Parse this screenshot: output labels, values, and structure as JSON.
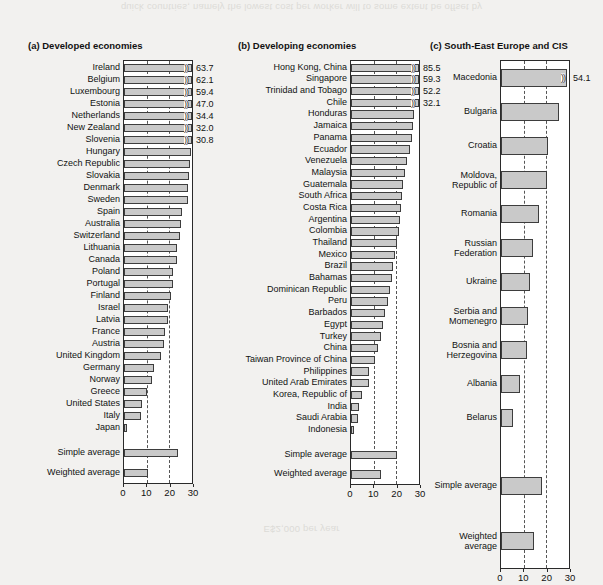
{
  "figure": {
    "bleed_top": "quick countries, namely the lowest cost per worker will to some extent be offset by",
    "bleed_bottom": "E$2,000 per year"
  },
  "axis": {
    "ticks": [
      0,
      10,
      20,
      30
    ],
    "tick_labels": [
      "0",
      "10",
      "20",
      "30"
    ],
    "gridlines": [
      10,
      20
    ],
    "xmin": 0,
    "xmax": 30
  },
  "colors": {
    "bar_fill": "#c9c9c9",
    "bar_stroke": "#3d3d3d",
    "grid": "#555555",
    "page_bg": "#f2f1ef",
    "plot_bg": "#ffffff"
  },
  "chart_data": [
    {
      "type": "bar",
      "title": "(a) Developed economies",
      "xlabel": "",
      "ylabel": "",
      "xlim": [
        0,
        30
      ],
      "grid": true,
      "orientation": "horizontal",
      "categories": [
        "Ireland",
        "Belgium",
        "Luxembourg",
        "Estonia",
        "Netherlands",
        "New Zealand",
        "Slovenia",
        "Hungary",
        "Czech Republic",
        "Slovakia",
        "Denmark",
        "Sweden",
        "Spain",
        "Australia",
        "Switzerland",
        "Lithuania",
        "Canada",
        "Poland",
        "Portugal",
        "Finland",
        "Israel",
        "Latvia",
        "France",
        "Austria",
        "United Kingdom",
        "Germany",
        "Norway",
        "Greece",
        "United States",
        "Italy",
        "Japan"
      ],
      "values": [
        63.7,
        62.1,
        59.4,
        47.0,
        34.4,
        32.0,
        30.8,
        29.4,
        28.9,
        28.6,
        28.4,
        28.2,
        25.4,
        25.2,
        24.8,
        23.4,
        23.2,
        21.7,
        21.4,
        20.9,
        19.6,
        19.3,
        18.1,
        17.5,
        16.3,
        13.4,
        12.2,
        10.2,
        7.9,
        7.4,
        1.4
      ],
      "clipped": [
        true,
        true,
        true,
        true,
        true,
        true,
        true,
        false,
        false,
        false,
        false,
        false,
        false,
        false,
        false,
        false,
        false,
        false,
        false,
        false,
        false,
        false,
        false,
        false,
        false,
        false,
        false,
        false,
        false,
        false,
        false
      ],
      "value_labels": [
        "63.7",
        "62.1",
        "59.4",
        "47.0",
        "34.4",
        "32.0",
        "30.8",
        "",
        "",
        "",
        "",
        "",
        "",
        "",
        "",
        "",
        "",
        "",
        "",
        "",
        "",
        "",
        "",
        "",
        "",
        "",
        "",
        "",
        "",
        "",
        ""
      ],
      "summary": [
        {
          "label": "Simple average",
          "value": 23.8
        },
        {
          "label": "Weighted average",
          "value": 10.6
        }
      ]
    },
    {
      "type": "bar",
      "title": "(b) Developing economies",
      "xlabel": "",
      "ylabel": "",
      "xlim": [
        0,
        30
      ],
      "grid": true,
      "orientation": "horizontal",
      "categories": [
        "Hong Kong, China",
        "Singapore",
        "Trinidad and Tobago",
        "Chile",
        "Honduras",
        "Jamaica",
        "Panama",
        "Ecuador",
        "Venezuela",
        "Malaysia",
        "Guatemala",
        "South Africa",
        "Costa Rica",
        "Argentina",
        "Colombia",
        "Thailand",
        "Mexico",
        "Brazil",
        "Bahamas",
        "Dominican Republic",
        "Peru",
        "Barbados",
        "Egypt",
        "Turkey",
        "China",
        "Taiwan Province of China",
        "Philippines",
        "United Arab Emirates",
        "Korea, Republic of",
        "India",
        "Saudi Arabia",
        "Indonesia"
      ],
      "values": [
        85.5,
        59.3,
        52.2,
        32.1,
        27.7,
        27.4,
        26.9,
        25.9,
        24.6,
        23.9,
        22.8,
        22.4,
        21.9,
        21.5,
        21.2,
        20.3,
        19.6,
        18.6,
        17.9,
        17.3,
        16.2,
        15.1,
        14.2,
        13.1,
        11.8,
        10.8,
        8.1,
        7.9,
        4.9,
        3.6,
        3.3,
        1.3
      ],
      "clipped": [
        true,
        true,
        true,
        true,
        false,
        false,
        false,
        false,
        false,
        false,
        false,
        false,
        false,
        false,
        false,
        false,
        false,
        false,
        false,
        false,
        false,
        false,
        false,
        false,
        false,
        false,
        false,
        false,
        false,
        false,
        false,
        false
      ],
      "value_labels": [
        "85.5",
        "59.3",
        "52.2",
        "32.1",
        "",
        "",
        "",
        "",
        "",
        "",
        "",
        "",
        "",
        "",
        "",
        "",
        "",
        "",
        "",
        "",
        "",
        "",
        "",
        "",
        "",
        "",
        "",
        "",
        "",
        "",
        "",
        ""
      ],
      "summary": [
        {
          "label": "Simple average",
          "value": 20.2
        },
        {
          "label": "Weighted average",
          "value": 13.2
        }
      ]
    },
    {
      "type": "bar",
      "title": "(c) South-East Europe and CIS",
      "xlabel": "",
      "ylabel": "",
      "xlim": [
        0,
        30
      ],
      "grid": true,
      "orientation": "horizontal",
      "categories": [
        "Macedonia",
        "Bulgaria",
        "Croatia",
        "Moldova,\nRepublic of",
        "Romania",
        "Russian\nFederation",
        "Ukraine",
        "Serbia and\nMomenegro",
        "Bosnia and\nHerzegovina",
        "Albania",
        "Belarus"
      ],
      "values": [
        28.9,
        25.6,
        20.6,
        20.3,
        16.9,
        13.9,
        12.9,
        11.7,
        11.6,
        8.4,
        5.1
      ],
      "clipped": [
        true,
        false,
        false,
        false,
        false,
        false,
        false,
        false,
        false,
        false,
        false
      ],
      "value_labels": [
        "54.1",
        "",
        "",
        "",
        "",
        "",
        "",
        "",
        "",
        "",
        ""
      ],
      "summary": [
        {
          "label": "Simple average",
          "value": 18.3
        },
        {
          "label": "Weighted average",
          "value": 14.4
        }
      ]
    }
  ]
}
